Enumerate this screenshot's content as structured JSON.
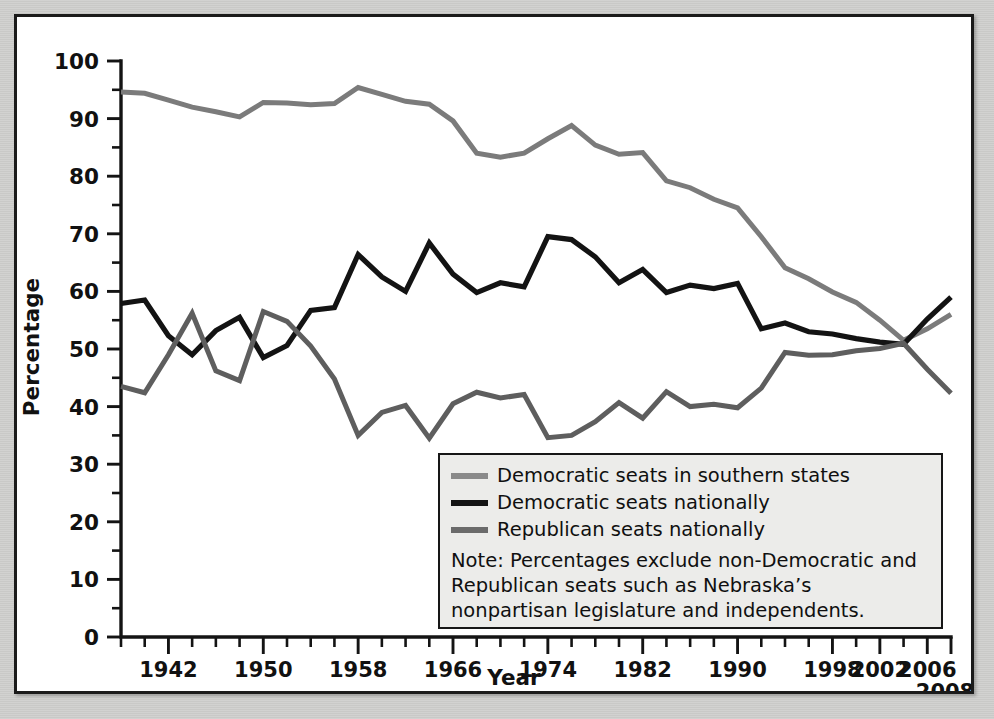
{
  "chart_data": {
    "type": "line",
    "title": "",
    "xlabel": "Year",
    "ylabel": "Percentage",
    "xlim": [
      1938,
      2008
    ],
    "ylim": [
      0,
      100
    ],
    "grid": false,
    "legend_position": "inside-bottom-right",
    "x_tick_labels": [
      "1942",
      "1950",
      "1958",
      "1966",
      "1974",
      "1982",
      "1990",
      "1998",
      "2002",
      "2006",
      "2008"
    ],
    "x_tick_values": [
      1942,
      1950,
      1958,
      1966,
      1974,
      1982,
      1990,
      1998,
      2002,
      2006,
      2008
    ],
    "x_minor_step": 2,
    "y_tick_labels": [
      "0",
      "10",
      "20",
      "30",
      "40",
      "50",
      "60",
      "70",
      "80",
      "90",
      "100"
    ],
    "y_tick_values": [
      0,
      10,
      20,
      30,
      40,
      50,
      60,
      70,
      80,
      90,
      100
    ],
    "y_minor_step": 5,
    "x": [
      1938,
      1940,
      1942,
      1944,
      1946,
      1948,
      1950,
      1952,
      1954,
      1956,
      1958,
      1960,
      1962,
      1964,
      1966,
      1968,
      1970,
      1972,
      1974,
      1976,
      1978,
      1980,
      1982,
      1984,
      1986,
      1988,
      1990,
      1992,
      1994,
      1996,
      1998,
      2000,
      2002,
      2004,
      2006,
      2008
    ],
    "series": [
      {
        "name": "Democratic seats in southern states",
        "color": "#7b7b7b",
        "values": [
          94.6,
          94.4,
          93.2,
          92.0,
          91.2,
          90.3,
          92.8,
          92.7,
          92.4,
          92.6,
          95.4,
          94.2,
          93.0,
          92.5,
          89.6,
          84.0,
          83.3,
          84.0,
          86.5,
          88.8,
          85.4,
          83.8,
          84.1,
          79.2,
          78.0,
          76.0,
          74.5,
          69.5,
          64.1,
          62.2,
          59.9,
          58.1,
          55.0,
          51.5,
          53.5,
          56.0
        ]
      },
      {
        "name": "Democratic seats nationally",
        "color": "#131313",
        "values": [
          57.9,
          58.5,
          52.3,
          49.0,
          53.2,
          55.5,
          48.5,
          50.6,
          56.7,
          57.2,
          66.4,
          62.5,
          60.0,
          68.4,
          63.0,
          59.8,
          61.5,
          60.8,
          69.5,
          69.0,
          66.0,
          61.5,
          63.8,
          59.8,
          61.1,
          60.5,
          61.4,
          53.5,
          54.5,
          53.0,
          52.6,
          51.8,
          51.2,
          50.8,
          55.2,
          59.0
        ]
      },
      {
        "name": "Republican seats nationally",
        "color": "#5e5e5e",
        "values": [
          43.5,
          42.4,
          49.0,
          56.2,
          46.2,
          44.5,
          56.5,
          54.8,
          50.5,
          44.8,
          35.0,
          39.0,
          40.2,
          34.5,
          40.5,
          42.5,
          41.5,
          42.1,
          34.6,
          35.0,
          37.4,
          40.7,
          38.0,
          42.6,
          40.0,
          40.4,
          39.8,
          43.2,
          49.4,
          48.9,
          49.0,
          49.7,
          50.1,
          51.0,
          46.5,
          42.3
        ]
      }
    ]
  },
  "axis": {
    "y_title": "Percentage",
    "x_title": "Year"
  },
  "legend": {
    "entries": [
      {
        "label": "Democratic seats in southern states",
        "swatch": "sw-dem-south"
      },
      {
        "label": "Democratic seats nationally",
        "swatch": "sw-dem-nat"
      },
      {
        "label": "Republican seats nationally",
        "swatch": "sw-rep-nat"
      }
    ],
    "note": "Note: Percentages exclude non-Democratic and Republican seats such as Nebraska’s nonpartisan legislature and independents."
  }
}
